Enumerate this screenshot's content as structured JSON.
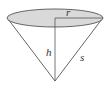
{
  "figure": {
    "labels": {
      "radius": "r",
      "height": "h",
      "slant": "s"
    },
    "colors": {
      "base_fill": "#d9d9d9",
      "stroke": "#555555",
      "background": "#ffffff"
    }
  }
}
